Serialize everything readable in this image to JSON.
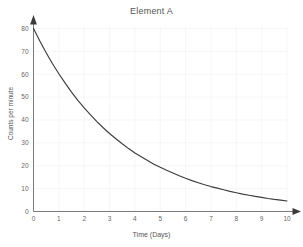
{
  "chart_data": {
    "type": "line",
    "title": "Element A",
    "xlabel": "Time (Days)",
    "ylabel": "Counts per minute",
    "xlim": [
      0,
      10
    ],
    "ylim": [
      0,
      80
    ],
    "grid": true,
    "legend": null,
    "x_ticks": [
      "0",
      "1",
      "2",
      "3",
      "4",
      "5",
      "6",
      "7",
      "8",
      "9",
      "10"
    ],
    "y_ticks": [
      "0",
      "10",
      "20",
      "30",
      "40",
      "50",
      "60",
      "70",
      "80"
    ],
    "x_tick_values": [
      0,
      1,
      2,
      3,
      4,
      5,
      6,
      7,
      8,
      9,
      10
    ],
    "y_tick_values": [
      0,
      10,
      20,
      30,
      40,
      50,
      60,
      70,
      80
    ],
    "series": [
      {
        "name": "Element A",
        "color": "#3c3c3c",
        "x": [
          0,
          0.25,
          0.5,
          0.75,
          1,
          1.25,
          1.5,
          1.75,
          2,
          2.25,
          2.5,
          2.75,
          3,
          3.25,
          3.5,
          3.75,
          4,
          4.25,
          4.5,
          4.75,
          5,
          5.25,
          5.5,
          5.75,
          6,
          6.25,
          6.5,
          6.75,
          7,
          7.25,
          7.5,
          7.75,
          8,
          8.25,
          8.5,
          8.75,
          9,
          9.25,
          9.5,
          9.75,
          10
        ],
        "y": [
          80.0,
          74.5,
          69.4,
          64.6,
          60.2,
          56.1,
          52.2,
          48.6,
          45.3,
          42.2,
          39.3,
          36.6,
          34.1,
          31.8,
          29.6,
          27.5,
          25.6,
          23.9,
          22.3,
          20.7,
          19.3,
          18.0,
          16.8,
          15.6,
          14.5,
          13.5,
          12.6,
          11.7,
          10.9,
          10.2,
          9.5,
          8.8,
          8.2,
          7.6,
          7.1,
          6.6,
          6.2,
          5.7,
          5.3,
          5.0,
          4.6
        ]
      }
    ]
  },
  "axis": {
    "y_arrow": "arrow-up-icon",
    "x_arrow": "arrow-right-icon"
  },
  "colors": {
    "curve": "#3c3c3c",
    "axis": "#7a7a7a",
    "grid": "#f2f2f4",
    "text": "#555555",
    "background": "#ffffff"
  }
}
